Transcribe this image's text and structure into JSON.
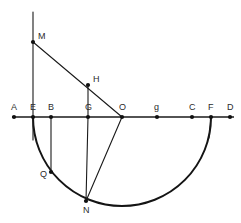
{
  "figure": {
    "kind": "geometry-construction-diagram",
    "width": 241,
    "height": 223,
    "background_color": "#ffffff",
    "stroke_color": "#1a1a1a",
    "label_color": "#2b2b2b"
  },
  "baseline": {
    "name": "horizontal-axis-line",
    "y": 117,
    "x_start": 12,
    "x_end": 234
  },
  "circle": {
    "name": "semicircle-arc",
    "center_x": 122,
    "center_y": 117,
    "radius": 89,
    "arc_from_label": "E",
    "arc_to_label": "F",
    "sweep": "lower-half"
  },
  "points": [
    {
      "id": "A",
      "label": "A",
      "x": 14,
      "y": 117,
      "label_dx": -3,
      "label_dy": -7,
      "on_axis": true
    },
    {
      "id": "E",
      "label": "E",
      "x": 33,
      "y": 117,
      "label_dx": -3,
      "label_dy": -7,
      "on_axis": true
    },
    {
      "id": "B",
      "label": "B",
      "x": 51,
      "y": 117,
      "label_dx": -3,
      "label_dy": -7,
      "on_axis": true
    },
    {
      "id": "G",
      "label": "G",
      "x": 88,
      "y": 117,
      "label_dx": -3,
      "label_dy": -7,
      "on_axis": true
    },
    {
      "id": "O",
      "label": "O",
      "x": 122,
      "y": 117,
      "label_dx": -3,
      "label_dy": -7,
      "on_axis": true
    },
    {
      "id": "g",
      "label": "g",
      "x": 157,
      "y": 117,
      "label_dx": -3,
      "label_dy": -7,
      "on_axis": true
    },
    {
      "id": "C",
      "label": "C",
      "x": 192,
      "y": 117,
      "label_dx": -3,
      "label_dy": -7,
      "on_axis": true
    },
    {
      "id": "F",
      "label": "F",
      "x": 211,
      "y": 117,
      "label_dx": -3,
      "label_dy": -7,
      "on_axis": true
    },
    {
      "id": "D",
      "label": "D",
      "x": 230,
      "y": 117,
      "label_dx": -3,
      "label_dy": -7,
      "on_axis": true
    },
    {
      "id": "M",
      "label": "M",
      "x": 33,
      "y": 42,
      "label_dx": 5,
      "label_dy": -3,
      "on_axis": false
    },
    {
      "id": "H",
      "label": "H",
      "x": 88,
      "y": 85,
      "label_dx": 5,
      "label_dy": -3,
      "on_axis": false
    },
    {
      "id": "N",
      "label": "N",
      "x": 86,
      "y": 201,
      "label_dx": -3,
      "label_dy": 12,
      "on_axis": false
    },
    {
      "id": "Q",
      "label": "Q",
      "x": 51,
      "y": 172,
      "label_dx": -11,
      "label_dy": 5,
      "on_axis": false
    }
  ],
  "segments": [
    {
      "name": "vertical-line-through-E",
      "x1": 33,
      "y1": 12,
      "x2": 33,
      "y2": 140
    },
    {
      "name": "segment-M-to-O",
      "x1": 33,
      "y1": 42,
      "x2": 122,
      "y2": 117
    },
    {
      "name": "segment-H-to-G",
      "x1": 88,
      "y1": 85,
      "x2": 88,
      "y2": 117
    },
    {
      "name": "segment-G-to-N",
      "x1": 88,
      "y1": 117,
      "x2": 86,
      "y2": 201
    },
    {
      "name": "segment-O-to-N",
      "x1": 122,
      "y1": 117,
      "x2": 86,
      "y2": 201
    },
    {
      "name": "segment-B-to-Q",
      "x1": 51,
      "y1": 117,
      "x2": 51,
      "y2": 172
    },
    {
      "name": "segment-F-downward",
      "x1": 211,
      "y1": 117,
      "x2": 209,
      "y2": 138
    }
  ]
}
